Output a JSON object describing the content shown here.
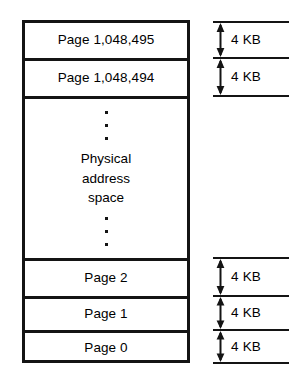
{
  "memory_box": {
    "rows": [
      {
        "id": "page-top-1",
        "label": "Page 1,048,495"
      },
      {
        "id": "page-top-2",
        "label": "Page 1,048,494"
      },
      {
        "id": "physical-address-space",
        "dots_above": [
          "•",
          "•",
          "•"
        ],
        "text_lines": [
          "Physical",
          "address",
          "space"
        ],
        "dots_below": [
          "•",
          "•",
          "•"
        ]
      },
      {
        "id": "page-2",
        "label": "Page 2"
      },
      {
        "id": "page-1",
        "label": "Page 1"
      },
      {
        "id": "page-0",
        "label": "Page 0"
      }
    ]
  },
  "measurements": {
    "top_group": [
      {
        "id": "measure-top-1",
        "label": "4 KB"
      },
      {
        "id": "measure-top-2",
        "label": "4 KB"
      }
    ],
    "bottom_group": [
      {
        "id": "measure-bottom-1",
        "label": "4 KB"
      },
      {
        "id": "measure-bottom-2",
        "label": "4 KB"
      },
      {
        "id": "measure-bottom-3",
        "label": "4 KB"
      }
    ]
  },
  "colors": {
    "ink": "#141414",
    "background": "#ffffff"
  }
}
